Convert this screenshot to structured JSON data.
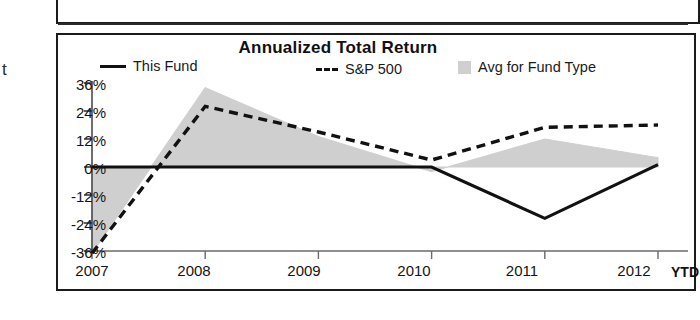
{
  "page": {
    "clipped_text_left": "t",
    "clipped_text_right": "YTD"
  },
  "chart": {
    "title": "Annualized Total Return",
    "legend": [
      {
        "name": "legend-this-fund",
        "label": "This Fund",
        "swatch": "solid-line",
        "color": "#111111"
      },
      {
        "name": "legend-sp500",
        "label": "S&P 500",
        "swatch": "dashed-line",
        "color": "#111111"
      },
      {
        "name": "legend-avg-fund-type",
        "label": "Avg for Fund Type",
        "swatch": "gray-square",
        "color": "#cfcfcf"
      }
    ]
  },
  "chart_data": {
    "type": "line",
    "title": "Annualized Total Return",
    "xlabel": "",
    "ylabel": "",
    "x": [
      "2007",
      "2008",
      "2009",
      "2010",
      "2011",
      "2012"
    ],
    "categories": [
      "2007",
      "2008",
      "2009",
      "2010",
      "2011",
      "2012"
    ],
    "xtick_labels": [
      "2007",
      "2008",
      "2009",
      "2010",
      "2011",
      "2012"
    ],
    "ytick_labels": [
      "36%",
      "24%",
      "12%",
      "0%",
      "-12%",
      "-24%",
      "-36%"
    ],
    "ytick_values": [
      36,
      24,
      12,
      0,
      -12,
      -24,
      -36
    ],
    "ylim": [
      -37,
      37
    ],
    "grid": false,
    "legend_position": "top",
    "series": [
      {
        "name": "This Fund",
        "style": "solid",
        "color": "#111111",
        "values": [
          0,
          0,
          0,
          0,
          -22,
          1
        ]
      },
      {
        "name": "S&P 500",
        "style": "dashed",
        "color": "#111111",
        "values": [
          -37,
          26,
          15,
          3,
          17,
          18
        ]
      },
      {
        "name": "Avg for Fund Type",
        "style": "filled-area",
        "color": "#cfcfcf",
        "values": [
          -37,
          34,
          13,
          -2,
          12,
          4
        ]
      }
    ],
    "annotations": [
      "YTD"
    ]
  }
}
